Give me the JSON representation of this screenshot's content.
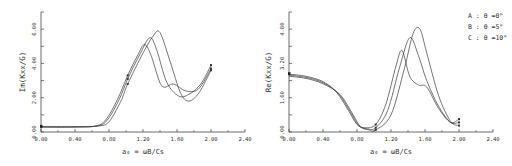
{
  "chart_data": [
    {
      "type": "line",
      "title": "",
      "xlabel": "a₀ = ωB/Cs",
      "ylabel": "Im(Kxx/G)",
      "xlim": [
        0.0,
        2.4
      ],
      "ylim": [
        0.0,
        7.0
      ],
      "x_ticks": [
        "0.00",
        "0.40",
        "0.80",
        "1.20",
        "1.60",
        "2.00",
        "2.40"
      ],
      "y_ticks": [
        "0.00",
        "2.00",
        "4.00",
        "6.00"
      ],
      "grid": false,
      "series": [
        {
          "name": "A: θ=0°",
          "x": [
            0.0,
            0.4,
            0.64,
            0.76,
            0.9,
            1.02,
            1.14,
            1.22,
            1.3,
            1.42,
            1.56,
            1.7,
            1.85,
            2.0
          ],
          "y": [
            0.3,
            0.3,
            0.35,
            0.7,
            1.9,
            3.3,
            4.5,
            5.1,
            4.4,
            2.7,
            2.8,
            2.4,
            2.5,
            3.7
          ]
        },
        {
          "name": "B: θ=5°",
          "x": [
            0.0,
            0.4,
            0.66,
            0.78,
            0.92,
            1.02,
            1.16,
            1.28,
            1.36,
            1.48,
            1.62,
            1.74,
            1.88,
            2.0
          ],
          "y": [
            0.3,
            0.3,
            0.35,
            0.7,
            1.9,
            3.1,
            4.5,
            5.5,
            4.8,
            2.9,
            2.1,
            2.2,
            2.8,
            3.9
          ]
        },
        {
          "name": "C: θ=10°",
          "x": [
            0.0,
            0.4,
            0.68,
            0.8,
            0.94,
            1.02,
            1.2,
            1.32,
            1.4,
            1.52,
            1.64,
            1.74,
            1.86,
            2.0
          ],
          "y": [
            0.3,
            0.3,
            0.35,
            0.6,
            1.8,
            2.8,
            4.6,
            5.6,
            5.8,
            4.1,
            2.3,
            1.8,
            2.3,
            3.6
          ]
        }
      ]
    },
    {
      "type": "line",
      "title": "",
      "xlabel": "a₀ = ωB/Cs",
      "ylabel": "Re(Kxx/G)",
      "xlim": [
        0.0,
        2.4
      ],
      "ylim": [
        0.0,
        5.6
      ],
      "x_ticks": [
        "0.00",
        "0.40",
        "0.80",
        "1.20",
        "1.60",
        "2.00",
        "2.40"
      ],
      "y_ticks": [
        "0.00",
        "1.60",
        "3.20",
        "4.80"
      ],
      "grid": false,
      "legend": [
        "A : θ =0°",
        "B : θ =5°",
        "C : θ =10°"
      ],
      "legend_position": "upper right",
      "series": [
        {
          "name": "A: θ=0°",
          "x": [
            0.0,
            0.2,
            0.4,
            0.56,
            0.7,
            0.8,
            0.9,
            1.02,
            1.14,
            1.26,
            1.33,
            1.42,
            1.52,
            1.62,
            1.76,
            1.9,
            2.0
          ],
          "y": [
            2.7,
            2.6,
            2.35,
            1.85,
            1.0,
            0.35,
            0.2,
            0.35,
            1.3,
            3.1,
            3.8,
            2.6,
            2.2,
            2.1,
            1.1,
            0.45,
            0.6
          ]
        },
        {
          "name": "B: θ=5°",
          "x": [
            0.0,
            0.2,
            0.4,
            0.58,
            0.72,
            0.82,
            0.92,
            1.02,
            1.16,
            1.3,
            1.42,
            1.52,
            1.62,
            1.76,
            1.9,
            2.0
          ],
          "y": [
            2.65,
            2.55,
            2.3,
            1.8,
            0.95,
            0.3,
            0.15,
            0.2,
            1.0,
            3.0,
            4.4,
            3.6,
            2.4,
            1.2,
            0.45,
            0.45
          ]
        },
        {
          "name": "C: θ=10°",
          "x": [
            0.0,
            0.2,
            0.4,
            0.6,
            0.74,
            0.84,
            0.94,
            1.02,
            1.2,
            1.36,
            1.46,
            1.54,
            1.62,
            1.76,
            1.9,
            2.0
          ],
          "y": [
            2.6,
            2.5,
            2.25,
            1.75,
            0.9,
            0.25,
            0.1,
            0.1,
            0.8,
            3.0,
            4.6,
            4.8,
            3.7,
            1.7,
            0.5,
            0.3
          ]
        }
      ]
    }
  ],
  "left": {
    "ylabel": "Im(Kxx/G)",
    "xlabel": "a₀ = ωB/Cs"
  },
  "right": {
    "ylabel": "Re(Kxx/G)",
    "xlabel": "a₀ = ωB/Cs",
    "legend": [
      "A : θ =0°",
      "B : θ =5°",
      "C : θ =10°"
    ]
  }
}
